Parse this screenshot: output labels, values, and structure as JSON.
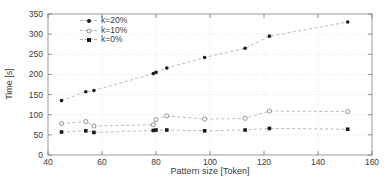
{
  "figure": {
    "background": "#ffffff",
    "frame_color": "#999999",
    "tick_color": "#777777",
    "grid_color": "#e0e0e0",
    "text_color": "#3a3a3a",
    "line_color": "#b2b2b2",
    "marker_fill": "#1a1a1a",
    "open_marker_color": "#8a8a8a"
  },
  "chart_data": {
    "type": "line",
    "title": "",
    "xlabel": "Pattern size [Token]",
    "ylabel": "Time [s]",
    "xlim": [
      40,
      160
    ],
    "ylim": [
      0,
      350
    ],
    "xticks": [
      40,
      60,
      80,
      100,
      120,
      140,
      160
    ],
    "yticks": [
      0,
      50,
      100,
      150,
      200,
      250,
      300,
      350
    ],
    "grid": true,
    "legend_position": "top-left",
    "line_style": "dashed",
    "x": [
      45,
      54,
      57,
      79,
      80,
      84,
      98,
      113,
      122,
      151
    ],
    "series": [
      {
        "name": "k=20%",
        "marker": "filled-circle",
        "values": [
          135,
          157,
          160,
          202,
          205,
          216,
          242,
          265,
          295,
          330
        ]
      },
      {
        "name": "k=10%",
        "marker": "open-circle",
        "values": [
          78,
          83,
          72,
          75,
          88,
          97,
          89,
          91,
          109,
          108
        ]
      },
      {
        "name": "k=0%",
        "marker": "filled-square",
        "values": [
          57,
          60,
          56,
          61,
          62,
          62,
          60,
          62,
          66,
          64
        ]
      }
    ]
  }
}
